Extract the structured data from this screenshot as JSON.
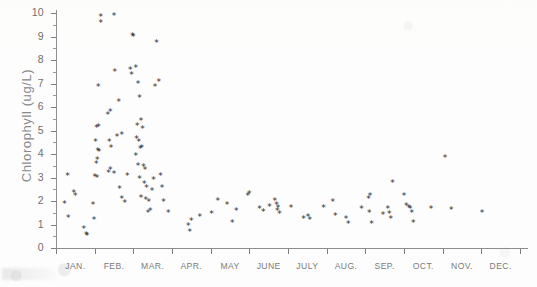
{
  "figure": {
    "kind": "scanned-scatter-plot",
    "background_color": "#fdfdfd",
    "ink_color": "#2b2b2b",
    "axis_color": "#8d8d8d",
    "label_color": "#7b7b7b"
  },
  "chart_data": {
    "type": "scatter",
    "title": "",
    "xlabel": "",
    "ylabel": "Chlorophyll (ug/L)",
    "ylim": [
      0,
      10
    ],
    "yticks": [
      0,
      1,
      2,
      3,
      4,
      5,
      6,
      7,
      8,
      9,
      10
    ],
    "ytick_labels": [
      "0",
      "1",
      "2",
      "3",
      "4",
      "5",
      "6",
      "7",
      "8",
      "9",
      "10"
    ],
    "y_minor_tick_step": 0.5,
    "grid": false,
    "legend": null,
    "marker": "asterisk",
    "categories": [
      "JAN.",
      "FEB.",
      "MAR.",
      "APR.",
      "MAY",
      "JUNE",
      "JULY",
      "AUG.",
      "SEP.",
      "OCT.",
      "NOV.",
      "DEC."
    ],
    "xtick_labels": [
      "JAN.",
      "FEB.",
      "MAR.",
      "APR.",
      "MAY",
      "JUNE",
      "JULY",
      "AUG.",
      "SEP.",
      "OCT.",
      "NOV.",
      "DEC."
    ],
    "x_axis_kind": "month-categorical",
    "xlim_months": [
      0.0,
      12.0
    ],
    "points": [
      {
        "x": 0.3,
        "y": 3.05
      },
      {
        "x": 0.22,
        "y": 1.85
      },
      {
        "x": 0.46,
        "y": 2.3
      },
      {
        "x": 0.5,
        "y": 2.2
      },
      {
        "x": 0.32,
        "y": 1.25
      },
      {
        "x": 0.72,
        "y": 0.78
      },
      {
        "x": 0.78,
        "y": 0.55
      },
      {
        "x": 0.8,
        "y": 0.48
      },
      {
        "x": 0.98,
        "y": 1.18
      },
      {
        "x": 0.96,
        "y": 1.82
      },
      {
        "x": 1.0,
        "y": 3.0
      },
      {
        "x": 1.06,
        "y": 2.95
      },
      {
        "x": 1.04,
        "y": 3.55
      },
      {
        "x": 1.07,
        "y": 3.72
      },
      {
        "x": 1.08,
        "y": 4.1
      },
      {
        "x": 1.11,
        "y": 4.05
      },
      {
        "x": 1.02,
        "y": 4.5
      },
      {
        "x": 1.05,
        "y": 5.1
      },
      {
        "x": 1.1,
        "y": 5.12
      },
      {
        "x": 1.09,
        "y": 6.85
      },
      {
        "x": 1.16,
        "y": 9.8
      },
      {
        "x": 1.16,
        "y": 9.55
      },
      {
        "x": 1.36,
        "y": 3.18
      },
      {
        "x": 1.4,
        "y": 3.3
      },
      {
        "x": 1.42,
        "y": 4.25
      },
      {
        "x": 1.38,
        "y": 4.5
      },
      {
        "x": 1.34,
        "y": 5.65
      },
      {
        "x": 1.4,
        "y": 5.75
      },
      {
        "x": 1.5,
        "y": 9.85
      },
      {
        "x": 1.52,
        "y": 7.45
      },
      {
        "x": 1.62,
        "y": 6.2
      },
      {
        "x": 1.58,
        "y": 4.72
      },
      {
        "x": 1.7,
        "y": 4.78
      },
      {
        "x": 1.5,
        "y": 3.12
      },
      {
        "x": 1.64,
        "y": 2.5
      },
      {
        "x": 1.7,
        "y": 2.05
      },
      {
        "x": 1.78,
        "y": 1.9
      },
      {
        "x": 1.84,
        "y": 3.05
      },
      {
        "x": 1.92,
        "y": 7.55
      },
      {
        "x": 1.95,
        "y": 7.35
      },
      {
        "x": 1.98,
        "y": 9.02
      },
      {
        "x": 2.0,
        "y": 8.95
      },
      {
        "x": 2.06,
        "y": 7.62
      },
      {
        "x": 2.12,
        "y": 6.95
      },
      {
        "x": 2.16,
        "y": 6.35
      },
      {
        "x": 2.2,
        "y": 5.4
      },
      {
        "x": 2.24,
        "y": 5.05
      },
      {
        "x": 2.1,
        "y": 5.15
      },
      {
        "x": 2.08,
        "y": 4.62
      },
      {
        "x": 2.14,
        "y": 4.48
      },
      {
        "x": 2.18,
        "y": 4.2
      },
      {
        "x": 2.22,
        "y": 4.22
      },
      {
        "x": 2.06,
        "y": 3.88
      },
      {
        "x": 2.12,
        "y": 3.45
      },
      {
        "x": 2.26,
        "y": 3.42
      },
      {
        "x": 2.3,
        "y": 3.3
      },
      {
        "x": 2.16,
        "y": 2.92
      },
      {
        "x": 2.28,
        "y": 2.72
      },
      {
        "x": 2.34,
        "y": 2.55
      },
      {
        "x": 2.2,
        "y": 2.12
      },
      {
        "x": 2.32,
        "y": 2.02
      },
      {
        "x": 2.4,
        "y": 1.92
      },
      {
        "x": 2.44,
        "y": 1.55
      },
      {
        "x": 2.38,
        "y": 1.45
      },
      {
        "x": 2.48,
        "y": 2.42
      },
      {
        "x": 2.52,
        "y": 2.88
      },
      {
        "x": 2.56,
        "y": 6.85
      },
      {
        "x": 2.6,
        "y": 8.72
      },
      {
        "x": 2.66,
        "y": 7.05
      },
      {
        "x": 2.7,
        "y": 3.05
      },
      {
        "x": 2.74,
        "y": 2.52
      },
      {
        "x": 2.78,
        "y": 1.92
      },
      {
        "x": 2.9,
        "y": 1.48
      },
      {
        "x": 3.42,
        "y": 0.92
      },
      {
        "x": 3.46,
        "y": 0.68
      },
      {
        "x": 3.5,
        "y": 1.12
      },
      {
        "x": 3.72,
        "y": 1.3
      },
      {
        "x": 4.02,
        "y": 1.42
      },
      {
        "x": 4.18,
        "y": 1.98
      },
      {
        "x": 4.42,
        "y": 1.82
      },
      {
        "x": 4.56,
        "y": 1.05
      },
      {
        "x": 4.66,
        "y": 1.55
      },
      {
        "x": 4.96,
        "y": 2.2
      },
      {
        "x": 5.0,
        "y": 2.28
      },
      {
        "x": 5.26,
        "y": 1.62
      },
      {
        "x": 5.36,
        "y": 1.52
      },
      {
        "x": 5.52,
        "y": 1.72
      },
      {
        "x": 5.66,
        "y": 2.0
      },
      {
        "x": 5.7,
        "y": 1.82
      },
      {
        "x": 5.74,
        "y": 1.7
      },
      {
        "x": 5.72,
        "y": 1.55
      },
      {
        "x": 5.78,
        "y": 1.42
      },
      {
        "x": 6.08,
        "y": 1.7
      },
      {
        "x": 6.4,
        "y": 1.22
      },
      {
        "x": 6.52,
        "y": 1.28
      },
      {
        "x": 6.56,
        "y": 1.15
      },
      {
        "x": 6.92,
        "y": 1.68
      },
      {
        "x": 7.16,
        "y": 1.92
      },
      {
        "x": 7.22,
        "y": 1.32
      },
      {
        "x": 7.5,
        "y": 1.22
      },
      {
        "x": 7.56,
        "y": 1.0
      },
      {
        "x": 7.9,
        "y": 1.62
      },
      {
        "x": 8.08,
        "y": 2.05
      },
      {
        "x": 8.12,
        "y": 2.18
      },
      {
        "x": 8.1,
        "y": 1.48
      },
      {
        "x": 8.16,
        "y": 0.98
      },
      {
        "x": 8.46,
        "y": 1.38
      },
      {
        "x": 8.58,
        "y": 1.62
      },
      {
        "x": 8.62,
        "y": 1.42
      },
      {
        "x": 8.66,
        "y": 1.2
      },
      {
        "x": 8.7,
        "y": 2.75
      },
      {
        "x": 9.0,
        "y": 2.18
      },
      {
        "x": 9.06,
        "y": 1.78
      },
      {
        "x": 9.12,
        "y": 1.7
      },
      {
        "x": 9.16,
        "y": 1.62
      },
      {
        "x": 9.2,
        "y": 1.45
      },
      {
        "x": 9.24,
        "y": 1.05
      },
      {
        "x": 9.7,
        "y": 1.62
      },
      {
        "x": 10.06,
        "y": 3.82
      },
      {
        "x": 10.22,
        "y": 1.58
      },
      {
        "x": 11.02,
        "y": 1.48
      }
    ],
    "n_points": 124
  }
}
